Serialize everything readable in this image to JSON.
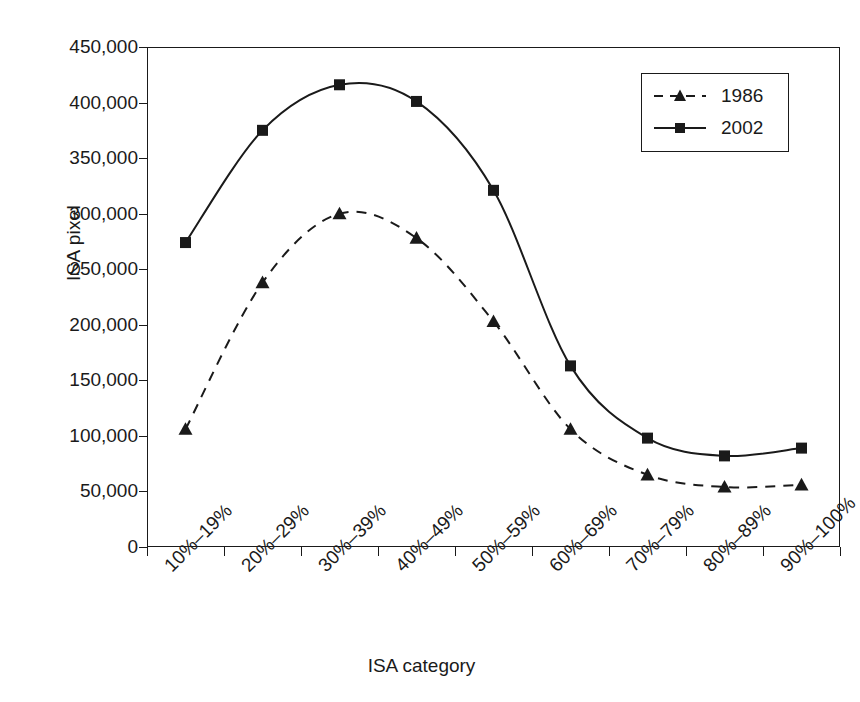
{
  "chart_data": {
    "type": "line",
    "title": "",
    "xlabel": "ISA category",
    "ylabel": "ISA pixel",
    "categories": [
      "10%–19%",
      "20%–29%",
      "30%–39%",
      "40%–49%",
      "50%–59%",
      "60%–69%",
      "70%–79%",
      "80%–89%",
      "90%–100%"
    ],
    "series": [
      {
        "name": "1986",
        "marker": "triangle",
        "line_style": "dashed",
        "color": "#1a1a1a",
        "values": [
          106000,
          238000,
          300000,
          278000,
          203000,
          106000,
          65000,
          54000,
          56000
        ]
      },
      {
        "name": "2002",
        "marker": "square",
        "line_style": "solid",
        "color": "#1a1a1a",
        "values": [
          274000,
          375000,
          416000,
          401000,
          321000,
          163000,
          98000,
          82000,
          89000
        ]
      }
    ],
    "ylim": [
      0,
      450000
    ],
    "ytick_values": [
      0,
      50000,
      100000,
      150000,
      200000,
      250000,
      300000,
      350000,
      400000,
      450000
    ],
    "ytick_labels": [
      "0",
      "50,000",
      "100,000",
      "150,000",
      "200,000",
      "250,000",
      "300,000",
      "350,000",
      "400,000",
      "450,000"
    ],
    "grid": false,
    "legend_position": "top-right",
    "legend_entries": [
      "1986",
      "2002"
    ]
  }
}
